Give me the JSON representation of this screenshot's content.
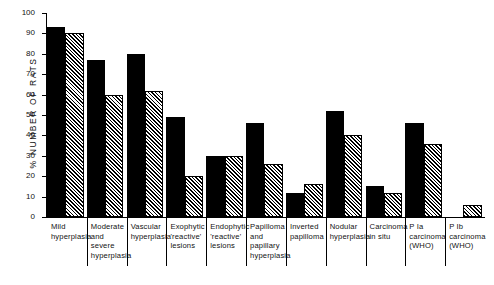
{
  "chart_data": {
    "type": "bar",
    "title": "",
    "subtitle": "",
    "xlabel": "",
    "ylabel": "% NUMBER OF RATS",
    "ylim": [
      0,
      100
    ],
    "ytick_step": 10,
    "yticks": [
      "100",
      "90",
      "80",
      "70",
      "60",
      "50",
      "40",
      "30",
      "20",
      "10",
      "0"
    ],
    "grid": false,
    "legend_position": "none",
    "bar_styles": [
      "solid-black",
      "diagonal-hatch"
    ],
    "categories": [
      "Mild\nhyperplasia",
      "Moderate\nand\nsevere\nhyperplasia",
      "Vascular\nhyperplasia",
      "Exophytic\n'reactive'\nlesions",
      "Endophytic\n'reactive'\nlesions",
      "Papilloma\nand\npapillary\nhyperplasia",
      "Inverted\npapilloma",
      "Nodular\nhyperplasia",
      "Carcinoma\nin situ",
      "P Ia\ncarcinoma\n(WHO)",
      "P Ib\ncarcinoma\n(WHO)"
    ],
    "series": [
      {
        "name": "Group 1",
        "style": "solid-black",
        "values": [
          93,
          77,
          80,
          49,
          30,
          46,
          12,
          52,
          15,
          46,
          0
        ]
      },
      {
        "name": "Group 2",
        "style": "diagonal-hatch",
        "values": [
          90,
          60,
          62,
          20,
          30,
          26,
          16,
          40,
          12,
          36,
          6
        ]
      }
    ]
  },
  "colors": {
    "series1": "#000000",
    "series2_hatch": "#000000",
    "series2_background": "#ffffff",
    "axis": "#000000",
    "page_background": "#ffffff"
  }
}
